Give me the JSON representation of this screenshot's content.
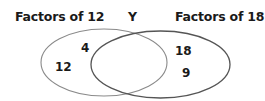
{
  "diagram": {
    "type": "venn",
    "universe_label": "Y",
    "sets": [
      {
        "name": "Factors of 12",
        "only_elements": [
          "4",
          "12"
        ],
        "stroke_color": "#8a8a8a"
      },
      {
        "name": "Factors of 18",
        "only_elements": [
          "18",
          "9"
        ],
        "stroke_color": "#555555"
      }
    ],
    "intersection_elements": []
  }
}
